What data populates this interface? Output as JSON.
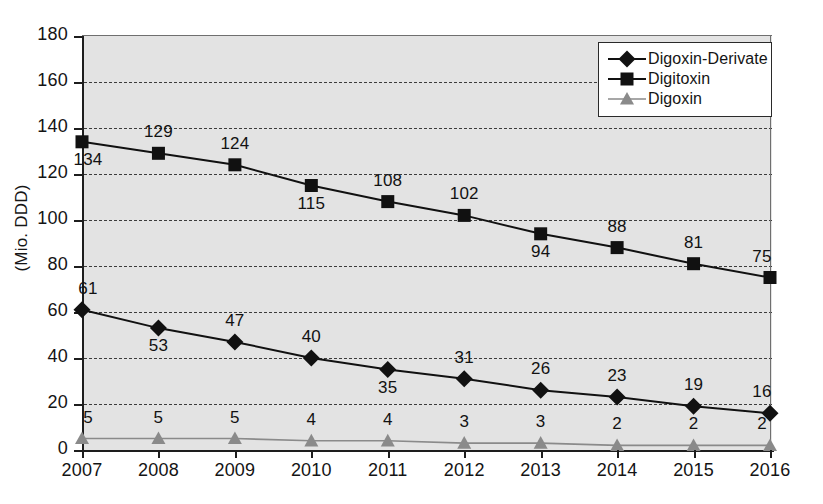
{
  "chart_data": {
    "type": "line",
    "title": "",
    "xlabel": "",
    "ylabel": "(Mio. DDD)",
    "categories": [
      "2007",
      "2008",
      "2009",
      "2010",
      "2011",
      "2012",
      "2013",
      "2014",
      "2015",
      "2016"
    ],
    "ylim": [
      0,
      180
    ],
    "yticks": [
      "0",
      "20",
      "40",
      "60",
      "80",
      "100",
      "120",
      "140",
      "160",
      "180"
    ],
    "grid": true,
    "legend_position": "top-right",
    "series": [
      {
        "name": "Digoxin-Derivate",
        "marker": "diamond",
        "color": "#111111",
        "values": [
          61,
          53,
          47,
          40,
          35,
          31,
          26,
          23,
          19,
          16
        ],
        "label_side": [
          "above",
          "below",
          "above",
          "above",
          "below",
          "above",
          "above",
          "above",
          "above",
          "above"
        ]
      },
      {
        "name": "Digitoxin",
        "marker": "square",
        "color": "#111111",
        "values": [
          134,
          129,
          124,
          115,
          108,
          102,
          94,
          88,
          81,
          75
        ],
        "label_side": [
          "below",
          "above",
          "above",
          "below",
          "above",
          "above",
          "below",
          "above",
          "above",
          "above"
        ]
      },
      {
        "name": "Digoxin",
        "marker": "triangle",
        "color": "#8a8a8a",
        "values": [
          5,
          5,
          5,
          4,
          4,
          3,
          3,
          2,
          2,
          2
        ],
        "label_side": [
          "above",
          "above",
          "above",
          "above",
          "above",
          "above",
          "above",
          "above",
          "above",
          "above"
        ]
      }
    ]
  },
  "legend": {
    "items": [
      {
        "label": "Digoxin-Derivate"
      },
      {
        "label": "Digitoxin"
      },
      {
        "label": "Digoxin"
      }
    ]
  }
}
